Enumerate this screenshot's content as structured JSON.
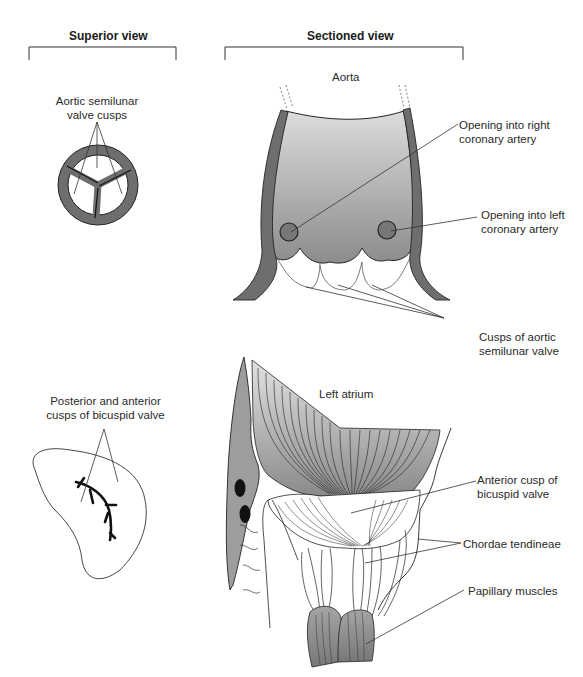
{
  "headers": {
    "superior": "Superior view",
    "sectioned": "Sectioned view"
  },
  "labels": {
    "aortic_cusps_superior": "Aortic semilunar\nvalve cusps",
    "bicuspid_cusps_superior": "Posterior and anterior\ncusps of bicuspid valve",
    "aorta": "Aorta",
    "right_coronary": "Opening into right\ncoronary artery",
    "left_coronary": "Opening into left\ncoronary artery",
    "aortic_cusps_sectioned": "Cusps of aortic\nsemilunar valve",
    "left_atrium": "Left atrium",
    "anterior_cusp": "Anterior cusp of\nbicuspid valve",
    "chordae": "Chordae tendineae",
    "papillary": "Papillary muscles"
  },
  "colors": {
    "wall_dark": "#6e6e6e",
    "fill_gradient_top": "#d9d9d9",
    "fill_gradient_bottom": "#8a8a8a",
    "line": "#1a1a1a",
    "nodule": "#111111"
  }
}
